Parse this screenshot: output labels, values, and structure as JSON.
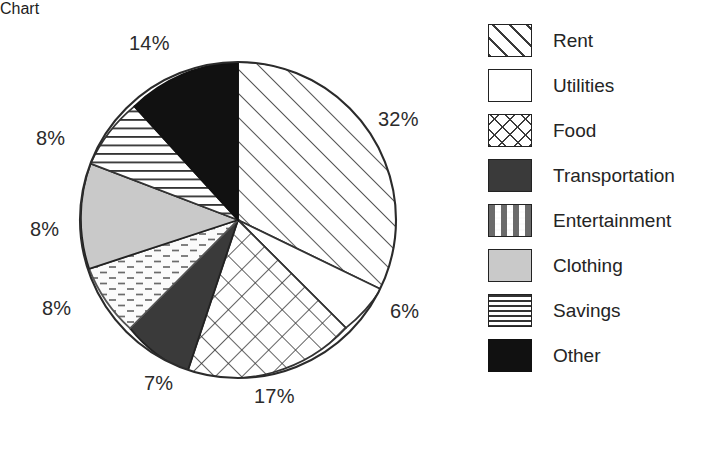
{
  "chart_data": {
    "type": "pie",
    "title": "",
    "subtitle": "",
    "xlabel": "",
    "ylabel": "",
    "grid": false,
    "legend_position": "right",
    "start_angle_deg": 0,
    "direction": "clockwise",
    "unit": "%",
    "categories": [
      "Rent",
      "Utilities",
      "Food",
      "Transportation",
      "Entertainment",
      "Clothing",
      "Savings",
      "Other"
    ],
    "values": [
      32,
      6,
      17,
      7,
      8,
      8,
      8,
      14
    ],
    "data_labels": [
      "32%",
      "6%",
      "17%",
      "7%",
      "8%",
      "8%",
      "8%",
      "14%"
    ],
    "slices": [
      {
        "label": "Rent",
        "value": 32,
        "data_label": "32%",
        "pattern": "diagonal-stripes",
        "fill": "#ffffff",
        "line": "#333333"
      },
      {
        "label": "Utilities",
        "value": 6,
        "data_label": "6%",
        "pattern": "solid-white",
        "fill": "#ffffff",
        "line": "#333333"
      },
      {
        "label": "Food",
        "value": 17,
        "data_label": "17%",
        "pattern": "crosshatch",
        "fill": "#ffffff",
        "line": "#333333"
      },
      {
        "label": "Transportation",
        "value": 7,
        "data_label": "7%",
        "pattern": "solid-dark-gray",
        "fill": "#3a3a3a",
        "line": "#222222"
      },
      {
        "label": "Entertainment",
        "value": 8,
        "data_label": "8%",
        "pattern": "dashes",
        "fill": "#fafafa",
        "line": "#555555"
      },
      {
        "label": "Clothing",
        "value": 8,
        "data_label": "8%",
        "pattern": "solid-light-gray",
        "fill": "#c9c9c9",
        "line": "#222222"
      },
      {
        "label": "Savings",
        "value": 8,
        "data_label": "8%",
        "pattern": "horizontal-lines",
        "fill": "#ffffff",
        "line": "#333333"
      },
      {
        "label": "Other",
        "value": 14,
        "data_label": "14%",
        "pattern": "solid-black",
        "fill": "#111111",
        "line": "#111111"
      }
    ]
  },
  "legend": {
    "items": [
      {
        "label": "Rent",
        "swatch": "diagonal-stripes-swatch"
      },
      {
        "label": "Utilities",
        "swatch": "blank-swatch"
      },
      {
        "label": "Food",
        "swatch": "crosshatch-swatch"
      },
      {
        "label": "Transportation",
        "swatch": "dark-gray-swatch"
      },
      {
        "label": "Entertainment",
        "swatch": "dashes-swatch"
      },
      {
        "label": "Clothing",
        "swatch": "light-gray-swatch"
      },
      {
        "label": "Savings",
        "swatch": "horizontal-lines-swatch"
      },
      {
        "label": "Other",
        "swatch": "black-swatch"
      }
    ]
  },
  "labels": {
    "rent": {
      "text": "32%",
      "left": 378,
      "top": 108
    },
    "utilities": {
      "text": "6%",
      "left": 390,
      "top": 300
    },
    "food": {
      "text": "17%",
      "left": 254,
      "top": 385
    },
    "transportation": {
      "text": "7%",
      "left": 144,
      "top": 372
    },
    "entertainment": {
      "text": "8%",
      "left": 42,
      "top": 297
    },
    "clothing": {
      "text": "8%",
      "left": 30,
      "top": 218
    },
    "savings": {
      "text": "8%",
      "left": 36,
      "top": 127
    },
    "other": {
      "text": "14%",
      "left": 129,
      "top": 32
    }
  },
  "colors": {
    "background": "#ffffff",
    "outline": "#2b2b2b",
    "text": "#242424",
    "dark_gray": "#3a3a3a",
    "light_gray": "#c9c9c9",
    "black": "#111111"
  }
}
